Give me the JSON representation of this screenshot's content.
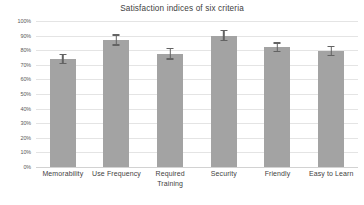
{
  "chart_data": {
    "type": "bar",
    "title": "Satisfaction indices of six criteria",
    "xlabel": "",
    "ylabel": "",
    "ylim": [
      0,
      100
    ],
    "yticks": [
      "0%",
      "10%",
      "20%",
      "30%",
      "40%",
      "50%",
      "60%",
      "70%",
      "80%",
      "90%",
      "100%"
    ],
    "ytick_values": [
      0,
      10,
      20,
      30,
      40,
      50,
      60,
      70,
      80,
      90,
      100
    ],
    "grid": true,
    "legend": "none",
    "units": "percent",
    "categories": [
      "Memorability",
      "Use Frequency",
      "Required Training",
      "Security",
      "Friendly",
      "Easy to Learn"
    ],
    "category_lines": [
      [
        "Memorability"
      ],
      [
        "Use Frequency"
      ],
      [
        "Required",
        "Training"
      ],
      [
        "Security"
      ],
      [
        "Friendly"
      ],
      [
        "Easy to Learn"
      ]
    ],
    "values": [
      74,
      87,
      77.5,
      90,
      82,
      79.5
    ],
    "errors": [
      3.5,
      4,
      4,
      4,
      3.5,
      3.5
    ],
    "series": [
      {
        "name": "Satisfaction index",
        "values": [
          74,
          87,
          77.5,
          90,
          82,
          79.5
        ],
        "errors": [
          3.5,
          4,
          4,
          4,
          3.5,
          3.5
        ]
      }
    ],
    "colors": {
      "bar_fill": "#a3a3a3",
      "error_bar": "#636363",
      "gridline": "#e4e4e4",
      "axis_line": "#d2d2d2",
      "title_text": "#404040",
      "tick_text": "#3f3f3f",
      "background": "#ffffff"
    }
  }
}
